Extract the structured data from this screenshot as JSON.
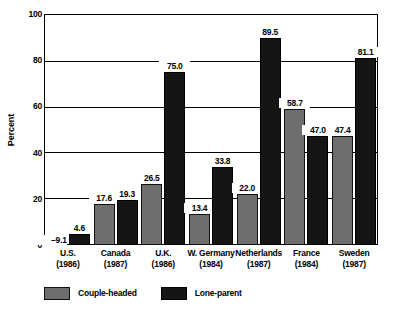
{
  "chart_data": {
    "type": "bar",
    "title": "",
    "xlabel": "",
    "ylabel": "Percent",
    "ylim": [
      0,
      100
    ],
    "yticks": [
      "0",
      "20",
      "40",
      "60",
      "80",
      "100"
    ],
    "grid": true,
    "legend_position": "bottom-left",
    "categories": [
      "U.S.",
      "Canada",
      "U.K.",
      "W. Germany",
      "Netherlands",
      "France",
      "Sweden"
    ],
    "category_years": [
      "(1986)",
      "(1987)",
      "(1986)",
      "(1984)",
      "(1987)",
      "(1984)",
      "(1987)"
    ],
    "series": [
      {
        "name": "Couple-headed",
        "color": "#6e6e6e",
        "values": [
          9.1,
          17.6,
          26.5,
          13.4,
          22.0,
          58.7,
          47.4
        ],
        "labels": [
          "–9.1",
          "17.6",
          "26.5",
          "13.4",
          "22.0",
          "58.7",
          "47.4"
        ]
      },
      {
        "name": "Lone-parent",
        "color": "#151515",
        "values": [
          4.6,
          19.3,
          75.0,
          33.8,
          89.5,
          47.0,
          81.1
        ],
        "labels": [
          "4.6",
          "19.3",
          "75.0",
          "33.8",
          "89.5",
          "47.0",
          "81.1"
        ]
      }
    ]
  },
  "legend": {
    "items": [
      {
        "label": "Couple-headed",
        "key": "couple"
      },
      {
        "label": "Lone-parent",
        "key": "lone"
      }
    ]
  }
}
